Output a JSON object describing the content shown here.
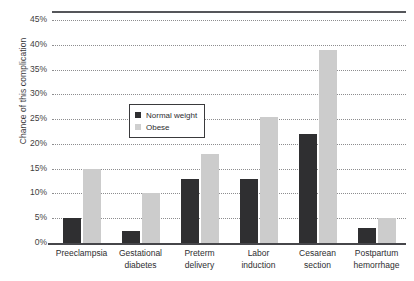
{
  "chart_data": {
    "type": "bar",
    "title": "",
    "xlabel": "",
    "ylabel": "Chance of this complication",
    "ylim": [
      0,
      45
    ],
    "grid": true,
    "legend_position": "inside-upper-left",
    "ytick_labels": [
      "0%",
      "5%",
      "10%",
      "15%",
      "20%",
      "25%",
      "30%",
      "35%",
      "40%",
      "45%"
    ],
    "ytick_values": [
      0,
      5,
      10,
      15,
      20,
      25,
      30,
      35,
      40,
      45
    ],
    "categories": [
      "Preeclampsia",
      "Gestational diabetes",
      "Preterm delivery",
      "Labor induction",
      "Cesarean section",
      "Postpartum hemorrhage"
    ],
    "category_lines": [
      [
        "Preeclampsia"
      ],
      [
        "Gestational",
        "diabetes"
      ],
      [
        "Preterm",
        "delivery"
      ],
      [
        "Labor",
        "induction"
      ],
      [
        "Cesarean",
        "section"
      ],
      [
        "Postpartum",
        "hemorrhage"
      ]
    ],
    "series": [
      {
        "name": "Normal weight",
        "color": "#2f2f31",
        "values": [
          5,
          2.5,
          13,
          13,
          22,
          3
        ]
      },
      {
        "name": "Obese",
        "color": "#cccccc",
        "values": [
          15,
          10,
          18,
          25.5,
          39,
          5
        ]
      }
    ]
  },
  "legend": {
    "items": [
      {
        "label": "Normal weight",
        "swatch": "normal"
      },
      {
        "label": "Obese",
        "swatch": "obese"
      }
    ]
  }
}
